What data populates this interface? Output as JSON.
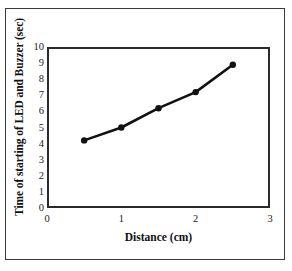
{
  "figure": {
    "background_color": "#ffffff",
    "frame_color": "#3a3a3a",
    "axis_color": "#2b2b2b",
    "series_color": "#111111"
  },
  "chart_data": {
    "type": "line",
    "title": "",
    "subtitle": "",
    "xlabel": "Distance (cm)",
    "ylabel": "Time of starting of LED and Buzzer (sec)",
    "x": [
      0.5,
      1.0,
      1.5,
      2.0,
      2.5
    ],
    "values": [
      4.2,
      5.0,
      6.2,
      7.2,
      8.9
    ],
    "series": [
      {
        "name": "Time of starting of LED and Buzzer",
        "x": [
          0.5,
          1.0,
          1.5,
          2.0,
          2.5
        ],
        "values": [
          4.2,
          5.0,
          6.2,
          7.2,
          8.9
        ],
        "marker": "filled-circle",
        "color": "#111111"
      }
    ],
    "xlim": [
      0,
      3
    ],
    "ylim": [
      0,
      10
    ],
    "xticks": [
      0,
      1,
      2,
      3
    ],
    "yticks": [
      0,
      1,
      2,
      3,
      4,
      5,
      6,
      7,
      8,
      9,
      10
    ],
    "xtick_labels": [
      "0",
      "1",
      "2",
      "3"
    ],
    "ytick_labels": [
      "0",
      "1",
      "2",
      "3",
      "4",
      "5",
      "6",
      "7",
      "8",
      "9",
      "10"
    ],
    "grid": false,
    "legend": false,
    "legend_position": "none",
    "annotations": []
  }
}
